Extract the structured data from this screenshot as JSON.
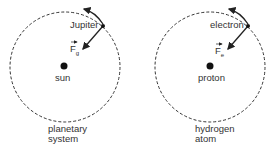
{
  "panels": [
    {
      "id": "planetary",
      "orbiting_body": "Jupiter",
      "force_symbol": "F",
      "force_subscript": "g",
      "center_body": "sun",
      "caption_line1": "planetary",
      "caption_line2": "system"
    },
    {
      "id": "hydrogen",
      "orbiting_body": "electron",
      "force_symbol": "F",
      "force_subscript": "e",
      "center_body": "proton",
      "caption_line1": "hydrogen",
      "caption_line2": "atom"
    }
  ],
  "colors": {
    "stroke": "#222222",
    "text": "#333333"
  }
}
